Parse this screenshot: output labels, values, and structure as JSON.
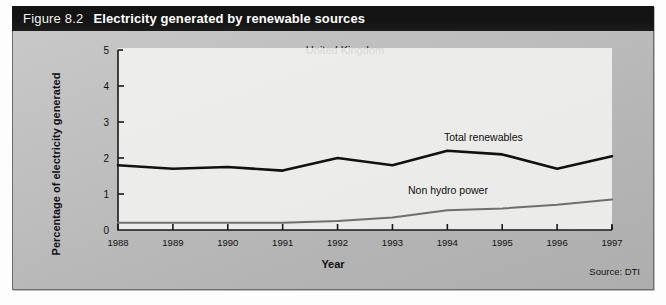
{
  "figure": {
    "number": "Figure 8.2",
    "title": "Electricity generated by renewable sources",
    "subtitle": "United Kingdom",
    "source": "Source: DTI"
  },
  "colors": {
    "banner_background": "#141414",
    "banner_text": "#ffffff",
    "panel_background": "#bfbfbf",
    "panel_border": "#6d6d6d",
    "plot_background": "#f4f4f2",
    "axis": "#1a1a1a",
    "series_total_renewables": "#111111",
    "series_non_hydro_power": "#6f6f6f"
  },
  "chart_data": {
    "type": "line",
    "title": "Electricity generated by renewable sources",
    "subtitle": "United Kingdom",
    "xlabel": "Year",
    "ylabel": "Percentage of electricity generated",
    "categories": [
      "1988",
      "1989",
      "1990",
      "1991",
      "1992",
      "1993",
      "1994",
      "1995",
      "1996",
      "1997"
    ],
    "x": [
      1988,
      1989,
      1990,
      1991,
      1992,
      1993,
      1994,
      1995,
      1996,
      1997
    ],
    "ylim": [
      0,
      5
    ],
    "yticks": [
      0,
      1,
      2,
      3,
      4,
      5
    ],
    "ytick_labels": [
      "0",
      "1",
      "2",
      "3",
      "4",
      "5"
    ],
    "xlim": [
      1988,
      1997
    ],
    "grid": false,
    "legend_position": "inline-annotation",
    "series": [
      {
        "name": "Total renewables",
        "color": "#111111",
        "values": [
          1.8,
          1.7,
          1.75,
          1.65,
          2.0,
          1.8,
          2.2,
          2.1,
          1.7,
          2.05
        ],
        "label_x": 1995.6,
        "label_y": 2.75
      },
      {
        "name": "Non hydro power",
        "color": "#6f6f6f",
        "values": [
          0.2,
          0.2,
          0.2,
          0.2,
          0.25,
          0.35,
          0.55,
          0.6,
          0.7,
          0.85
        ],
        "label_x": 1994.3,
        "label_y": 1.28
      }
    ],
    "annotations": [
      {
        "text": "United Kingdom",
        "x": 1992.5,
        "y": 4.82
      },
      {
        "text": "Source: DTI",
        "x": 1997.0,
        "y": -0.95
      }
    ]
  }
}
